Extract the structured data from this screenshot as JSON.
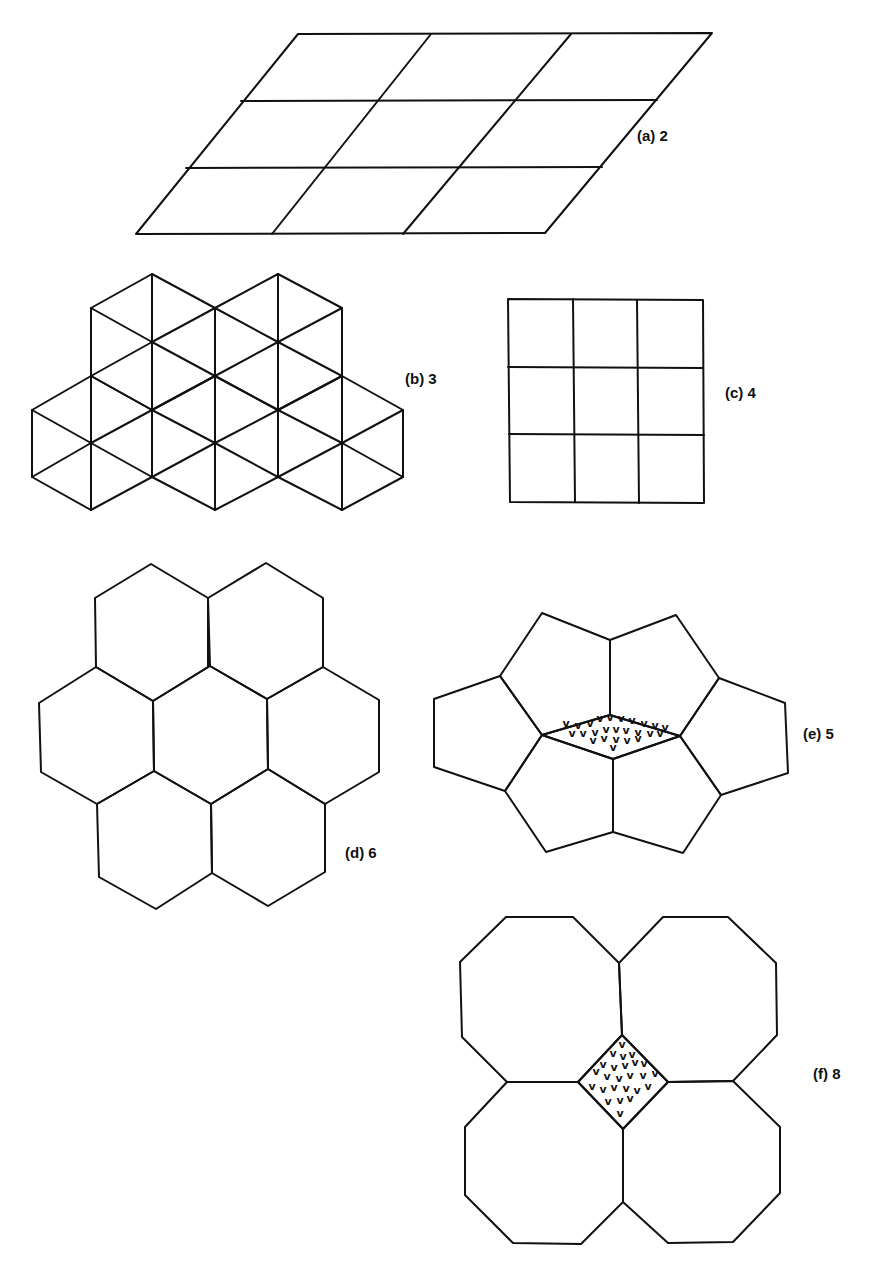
{
  "figure": {
    "background": "#ffffff",
    "stroke_color": "#111111",
    "mark_glyph": "v"
  },
  "panels": [
    {
      "id": "a",
      "label": "(a) 2",
      "label_pos": [
        637,
        128
      ],
      "description": "parallelogram lattice",
      "polygons": [
        [
          [
            298,
            34
          ],
          [
            712,
            33
          ],
          [
            545,
            233
          ],
          [
            136,
            234
          ]
        ]
      ],
      "lines": [
        [
          [
            241,
            101
          ],
          [
            657,
            100
          ]
        ],
        [
          [
            186,
            168
          ],
          [
            602,
            167
          ]
        ],
        [
          [
            431,
            34
          ],
          [
            272,
            234
          ]
        ],
        [
          [
            571,
            34
          ],
          [
            403,
            234
          ]
        ]
      ]
    },
    {
      "id": "b",
      "label": "(b) 3",
      "label_pos": [
        405,
        371
      ],
      "description": "triangular lattice (hexagons with spokes)",
      "hexagons_with_spokes": [
        {
          "center": [
            152,
            342
          ],
          "vertices": [
            [
              152,
              274
            ],
            [
              215,
              308
            ],
            [
              215,
              376
            ],
            [
              152,
              410
            ],
            [
              91,
              376
            ],
            [
              91,
              308
            ]
          ]
        },
        {
          "center": [
            278,
            342
          ],
          "vertices": [
            [
              278,
              274
            ],
            [
              342,
              308
            ],
            [
              342,
              376
            ],
            [
              278,
              410
            ],
            [
              215,
              376
            ],
            [
              215,
              308
            ]
          ]
        },
        {
          "center": [
            91,
            443
          ],
          "vertices": [
            [
              91,
              376
            ],
            [
              152,
              410
            ],
            [
              152,
              477
            ],
            [
              91,
              510
            ],
            [
              32,
              477
            ],
            [
              32,
              410
            ]
          ]
        },
        {
          "center": [
            215,
            443
          ],
          "vertices": [
            [
              215,
              376
            ],
            [
              278,
              410
            ],
            [
              278,
              477
            ],
            [
              215,
              510
            ],
            [
              152,
              477
            ],
            [
              152,
              410
            ]
          ]
        },
        {
          "center": [
            342,
            443
          ],
          "vertices": [
            [
              342,
              376
            ],
            [
              403,
              410
            ],
            [
              403,
              477
            ],
            [
              342,
              510
            ],
            [
              278,
              477
            ],
            [
              278,
              410
            ]
          ]
        }
      ]
    },
    {
      "id": "c",
      "label": "(c) 4",
      "label_pos": [
        725,
        385
      ],
      "description": "square lattice",
      "polygons": [
        [
          [
            508,
            299
          ],
          [
            703,
            300
          ],
          [
            704,
            503
          ],
          [
            510,
            502
          ]
        ]
      ],
      "lines": [
        [
          [
            573,
            299
          ],
          [
            575,
            502
          ]
        ],
        [
          [
            637,
            300
          ],
          [
            639,
            503
          ]
        ],
        [
          [
            508,
            367
          ],
          [
            703,
            368
          ]
        ],
        [
          [
            509,
            434
          ],
          [
            704,
            435
          ]
        ]
      ]
    },
    {
      "id": "d",
      "label": "(d) 6",
      "label_pos": [
        345,
        845
      ],
      "description": "hexagonal tiling",
      "polygons": [
        [
          [
            151,
            564
          ],
          [
            208,
            598
          ],
          [
            208,
            667
          ],
          [
            153,
            701
          ],
          [
            96,
            667
          ],
          [
            95,
            598
          ]
        ],
        [
          [
            266,
            563
          ],
          [
            323,
            598
          ],
          [
            323,
            667
          ],
          [
            267,
            699
          ],
          [
            210,
            666
          ],
          [
            208,
            598
          ]
        ],
        [
          [
            96,
            667
          ],
          [
            153,
            701
          ],
          [
            154,
            771
          ],
          [
            97,
            804
          ],
          [
            41,
            772
          ],
          [
            39,
            703
          ]
        ],
        [
          [
            153,
            701
          ],
          [
            210,
            666
          ],
          [
            267,
            699
          ],
          [
            268,
            769
          ],
          [
            211,
            804
          ],
          [
            154,
            771
          ]
        ],
        [
          [
            267,
            699
          ],
          [
            323,
            667
          ],
          [
            379,
            700
          ],
          [
            379,
            772
          ],
          [
            325,
            804
          ],
          [
            268,
            769
          ]
        ],
        [
          [
            97,
            804
          ],
          [
            154,
            771
          ],
          [
            211,
            804
          ],
          [
            212,
            873
          ],
          [
            156,
            909
          ],
          [
            99,
            877
          ]
        ],
        [
          [
            211,
            804
          ],
          [
            268,
            769
          ],
          [
            325,
            804
          ],
          [
            325,
            872
          ],
          [
            268,
            906
          ],
          [
            212,
            873
          ]
        ]
      ]
    },
    {
      "id": "e",
      "label": "(e) 5",
      "label_pos": [
        803,
        726
      ],
      "description": "pentagonal tiling with shaded rhombus gap",
      "polygons": [
        [
          [
            542,
            613
          ],
          [
            610,
            640
          ],
          [
            610,
            715
          ],
          [
            542,
            735
          ],
          [
            500,
            676
          ]
        ],
        [
          [
            610,
            640
          ],
          [
            676,
            615
          ],
          [
            719,
            678
          ],
          [
            680,
            736
          ],
          [
            610,
            715
          ]
        ],
        [
          [
            719,
            678
          ],
          [
            785,
            703
          ],
          [
            788,
            773
          ],
          [
            721,
            795
          ],
          [
            680,
            736
          ]
        ],
        [
          [
            542,
            735
          ],
          [
            613,
            759
          ],
          [
            613,
            832
          ],
          [
            546,
            852
          ],
          [
            505,
            791
          ]
        ],
        [
          [
            613,
            759
          ],
          [
            680,
            736
          ],
          [
            721,
            795
          ],
          [
            683,
            853
          ],
          [
            613,
            832
          ]
        ],
        [
          [
            500,
            676
          ],
          [
            542,
            735
          ],
          [
            505,
            791
          ],
          [
            434,
            767
          ],
          [
            434,
            699
          ]
        ]
      ],
      "shaded": [
        [
          542,
          735
        ],
        [
          610,
          715
        ],
        [
          680,
          736
        ],
        [
          613,
          759
        ]
      ],
      "marks": [
        [
          566,
          727
        ],
        [
          578,
          729
        ],
        [
          590,
          727
        ],
        [
          600,
          722
        ],
        [
          610,
          721
        ],
        [
          621,
          722
        ],
        [
          632,
          724
        ],
        [
          644,
          727
        ],
        [
          655,
          729
        ],
        [
          665,
          731
        ],
        [
          572,
          737
        ],
        [
          583,
          737
        ],
        [
          595,
          736
        ],
        [
          606,
          733
        ],
        [
          616,
          733
        ],
        [
          626,
          734
        ],
        [
          638,
          736
        ],
        [
          650,
          737
        ],
        [
          660,
          737
        ],
        [
          593,
          744
        ],
        [
          604,
          742
        ],
        [
          616,
          743
        ],
        [
          627,
          744
        ],
        [
          638,
          742
        ],
        [
          613,
          751
        ]
      ]
    },
    {
      "id": "f",
      "label": "(f) 8",
      "label_pos": [
        813,
        1066
      ],
      "description": "octagon-square tiling with shaded square",
      "polygons": [
        [
          [
            506,
            917
          ],
          [
            573,
            917
          ],
          [
            619,
            963
          ],
          [
            622,
            1035
          ],
          [
            578,
            1082
          ],
          [
            507,
            1082
          ],
          [
            462,
            1037
          ],
          [
            460,
            962
          ]
        ],
        [
          [
            663,
            917
          ],
          [
            728,
            917
          ],
          [
            776,
            963
          ],
          [
            777,
            1035
          ],
          [
            733,
            1081
          ],
          [
            668,
            1082
          ],
          [
            622,
            1035
          ],
          [
            619,
            963
          ]
        ],
        [
          [
            507,
            1082
          ],
          [
            578,
            1082
          ],
          [
            623,
            1129
          ],
          [
            623,
            1202
          ],
          [
            581,
            1244
          ],
          [
            513,
            1243
          ],
          [
            465,
            1195
          ],
          [
            465,
            1127
          ]
        ],
        [
          [
            668,
            1082
          ],
          [
            733,
            1081
          ],
          [
            780,
            1127
          ],
          [
            780,
            1193
          ],
          [
            733,
            1242
          ],
          [
            668,
            1243
          ],
          [
            623,
            1202
          ],
          [
            623,
            1129
          ]
        ]
      ],
      "shaded": [
        [
          622,
          1035
        ],
        [
          668,
          1082
        ],
        [
          623,
          1129
        ],
        [
          578,
          1082
        ]
      ],
      "marks": [
        [
          622,
          1048
        ],
        [
          613,
          1057
        ],
        [
          623,
          1060
        ],
        [
          632,
          1058
        ],
        [
          603,
          1068
        ],
        [
          614,
          1071
        ],
        [
          625,
          1069
        ],
        [
          635,
          1066
        ],
        [
          644,
          1067
        ],
        [
          596,
          1075
        ],
        [
          607,
          1080
        ],
        [
          619,
          1082
        ],
        [
          630,
          1079
        ],
        [
          643,
          1079
        ],
        [
          655,
          1077
        ],
        [
          592,
          1090
        ],
        [
          603,
          1093
        ],
        [
          614,
          1091
        ],
        [
          626,
          1092
        ],
        [
          637,
          1094
        ],
        [
          648,
          1090
        ],
        [
          608,
          1105
        ],
        [
          620,
          1104
        ],
        [
          630,
          1102
        ],
        [
          620,
          1117
        ]
      ]
    }
  ]
}
